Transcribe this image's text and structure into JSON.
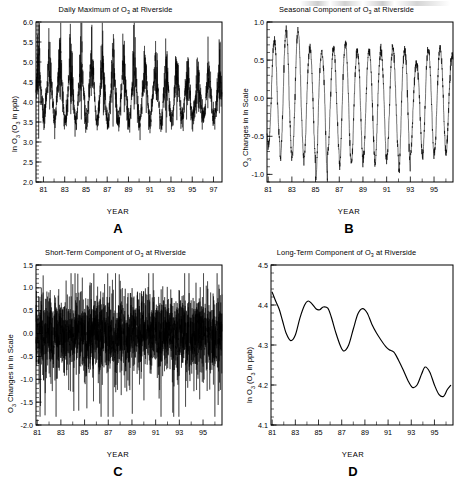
{
  "figure": {
    "panel_letters": [
      "A",
      "B",
      "C",
      "D"
    ],
    "axis_x_label": "YEAR"
  },
  "chart_data": [
    {
      "id": "A",
      "type": "line",
      "title": "Daily Maximum of O3 at Riverside",
      "title_parts": [
        "Daily Maximum of O",
        "3",
        " at Riverside"
      ],
      "xlabel": "YEAR",
      "ylabel": "ln O3 (O3 in ppb)",
      "ylabel_parts": [
        "ln O",
        "3",
        " (O",
        "3",
        " in ppb)"
      ],
      "xlim": [
        1980.3,
        1997.8
      ],
      "ylim": [
        2.0,
        6.0
      ],
      "xticks": [
        1981,
        1982,
        1983,
        1984,
        1985,
        1986,
        1987,
        1988,
        1989,
        1990,
        1991,
        1992,
        1993,
        1994,
        1995,
        1996,
        1997
      ],
      "xticklabels": [
        "81",
        "",
        "83",
        "",
        "85",
        "",
        "87",
        "",
        "89",
        "",
        "91",
        "",
        "93",
        "",
        "95",
        "",
        "97"
      ],
      "yticks": [
        2.0,
        2.5,
        3.0,
        3.5,
        4.0,
        4.5,
        5.0,
        5.5,
        6.0
      ],
      "yticklabels": [
        "2.0",
        "2.5",
        "3.0",
        "3.5",
        "4.0",
        "4.5",
        "5.0",
        "5.5",
        "6.0"
      ],
      "y_minor_step": 0.1,
      "grid": false,
      "description": "Dense daily maximum ozone series with strong annual cycle; summer peaks near 5.5-6.0 declining slightly over time, winter minima near 2.3-3.0.",
      "seasonal_envelope": {
        "summer_peak": [
          5.95,
          5.9,
          5.85,
          5.9,
          5.95,
          5.9,
          5.75,
          5.7,
          5.75,
          5.6,
          5.65,
          5.6,
          5.5,
          5.45,
          5.3,
          5.35,
          5.3
        ],
        "winter_trough": [
          2.35,
          2.3,
          2.35,
          2.3,
          2.35,
          2.4,
          2.35,
          2.3,
          2.3,
          2.45,
          2.55,
          2.5,
          2.6,
          2.7,
          2.75,
          2.8,
          2.95
        ],
        "summer_mean": [
          4.95,
          4.95,
          4.9,
          4.95,
          4.95,
          4.9,
          4.85,
          4.8,
          4.85,
          4.75,
          4.8,
          4.75,
          4.7,
          4.65,
          4.55,
          4.6,
          4.55
        ],
        "winter_mean": [
          3.55,
          3.5,
          3.5,
          3.5,
          3.5,
          3.5,
          3.45,
          3.45,
          3.45,
          3.5,
          3.55,
          3.5,
          3.55,
          3.6,
          3.6,
          3.6,
          3.65
        ]
      }
    },
    {
      "id": "B",
      "type": "line",
      "title": "Seasonal Component of O3 at Riverside",
      "title_parts": [
        "Seasonal Component of O",
        "3",
        " at Riverside"
      ],
      "xlabel": "YEAR",
      "ylabel": "O3 Changes in ln Scale",
      "ylabel_parts": [
        "O",
        "3",
        " Changes in ln Scale"
      ],
      "xlim": [
        1980.9,
        1996.6
      ],
      "ylim": [
        -1.1,
        1.0
      ],
      "xticks": [
        1981,
        1982,
        1983,
        1984,
        1985,
        1986,
        1987,
        1988,
        1989,
        1990,
        1991,
        1992,
        1993,
        1994,
        1995,
        1996
      ],
      "xticklabels": [
        "81",
        "",
        "83",
        "",
        "85",
        "",
        "87",
        "",
        "89",
        "",
        "91",
        "",
        "93",
        "",
        "95",
        ""
      ],
      "yticks": [
        -1.0,
        -0.5,
        0.0,
        0.5,
        1.0
      ],
      "yticklabels": [
        "-1.0",
        "-0.5",
        "0.0",
        "0.5",
        "1.0"
      ],
      "y_minor_step": 0.1,
      "grid": false,
      "description": "Regular annual sinusoid-like seasonal component, peaks 0.5-0.9 in summer, troughs -0.7 to -1.05 in winter.",
      "cycle_peaks": [
        0.78,
        0.9,
        0.88,
        0.66,
        0.6,
        0.66,
        0.72,
        0.62,
        0.63,
        0.62,
        0.66,
        0.62,
        0.46,
        0.64,
        0.66,
        0.56
      ],
      "cycle_troughs": [
        -0.63,
        -0.8,
        -0.78,
        -0.83,
        -1.03,
        -0.72,
        -0.88,
        -0.85,
        -0.8,
        -0.86,
        -0.78,
        -0.96,
        -0.72,
        -0.77,
        -0.72,
        -0.7
      ]
    },
    {
      "id": "C",
      "type": "line",
      "title": "Short-Term Component of O3 at Riverside",
      "title_parts": [
        "Short-Term Component of O",
        "3",
        " at Riverside"
      ],
      "xlabel": "YEAR",
      "ylabel": "O3 Changes in ln Scale",
      "ylabel_parts": [
        "O",
        "3",
        " Changes in ln Scale"
      ],
      "xlim": [
        1980.9,
        1996.6
      ],
      "ylim": [
        -2.0,
        1.5
      ],
      "xticks": [
        1981,
        1982,
        1983,
        1984,
        1985,
        1986,
        1987,
        1988,
        1989,
        1990,
        1991,
        1992,
        1993,
        1994,
        1995,
        1996
      ],
      "xticklabels": [
        "81",
        "",
        "83",
        "",
        "85",
        "",
        "87",
        "",
        "89",
        "",
        "91",
        "",
        "93",
        "",
        "95",
        ""
      ],
      "yticks": [
        -2.0,
        -1.5,
        -1.0,
        -0.5,
        0.0,
        0.5,
        1.0,
        1.5
      ],
      "yticklabels": [
        "-2.0",
        "-1.5",
        "-1.0",
        "-0.5",
        "0.0",
        "0.5",
        "1.0",
        "1.5"
      ],
      "y_minor_step": 0.1,
      "grid": false,
      "description": "High-frequency residual noise centered on zero; typical range -0.8 to +0.8 with extremes reaching +1.3 and -1.8.",
      "noise_band": {
        "sd": 0.42,
        "max": 1.32,
        "min": -1.82,
        "mean": 0.0
      }
    },
    {
      "id": "D",
      "type": "line",
      "title": "Long-Term Component of O3 at Riverside",
      "title_parts": [
        "Long-Term Component of O",
        "3",
        " at Riverside"
      ],
      "xlabel": "YEAR",
      "ylabel": "ln O3 (O3 in ppb)",
      "ylabel_parts": [
        "ln O",
        "3",
        " (O",
        "3",
        " in ppb)"
      ],
      "xlim": [
        1980.9,
        1996.6
      ],
      "ylim": [
        4.1,
        4.5
      ],
      "xticks": [
        1981,
        1982,
        1983,
        1984,
        1985,
        1986,
        1987,
        1988,
        1989,
        1990,
        1991,
        1992,
        1993,
        1994,
        1995,
        1996
      ],
      "xticklabels": [
        "81",
        "",
        "83",
        "",
        "85",
        "",
        "87",
        "",
        "89",
        "",
        "91",
        "",
        "93",
        "",
        "95",
        ""
      ],
      "yticks": [
        4.1,
        4.2,
        4.3,
        4.4,
        4.5
      ],
      "yticklabels": [
        "4.1",
        "4.2",
        "4.3",
        "4.4",
        "4.5"
      ],
      "y_minor_step": 0.02,
      "grid": false,
      "description": "Smooth long-term trend starting near 4.43 in 1981, dipping to 4.31 in 1982.6, rising to 4.41 by 1984, second dip to 4.285 at 1987, rebound to 4.39 at 1988.8, then sustained decline to 4.19 by 1993 and 4.17 by 1995.4, ending near 4.20.",
      "x": [
        1981.0,
        1981.3,
        1981.6,
        1981.9,
        1982.2,
        1982.6,
        1983.0,
        1983.4,
        1983.8,
        1984.1,
        1984.4,
        1984.8,
        1985.1,
        1985.4,
        1985.8,
        1986.1,
        1986.5,
        1986.9,
        1987.2,
        1987.6,
        1988.0,
        1988.4,
        1988.8,
        1989.2,
        1989.6,
        1990.0,
        1990.4,
        1990.8,
        1991.1,
        1991.5,
        1991.9,
        1992.3,
        1992.7,
        1993.1,
        1993.5,
        1993.9,
        1994.2,
        1994.6,
        1995.0,
        1995.4,
        1995.8,
        1996.1,
        1996.4
      ],
      "y": [
        4.432,
        4.41,
        4.39,
        4.36,
        4.33,
        4.311,
        4.325,
        4.368,
        4.4,
        4.41,
        4.404,
        4.39,
        4.388,
        4.395,
        4.392,
        4.37,
        4.33,
        4.297,
        4.285,
        4.3,
        4.34,
        4.378,
        4.391,
        4.38,
        4.352,
        4.33,
        4.312,
        4.296,
        4.288,
        4.282,
        4.262,
        4.238,
        4.212,
        4.194,
        4.2,
        4.228,
        4.245,
        4.232,
        4.2,
        4.176,
        4.172,
        4.188,
        4.199
      ]
    }
  ]
}
